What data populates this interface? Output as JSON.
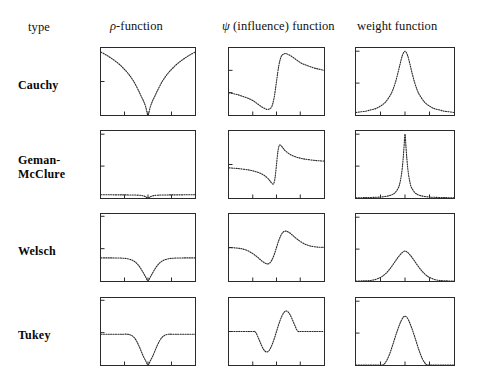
{
  "figure": {
    "kind": "robust-m-estimator-function-table",
    "background": "#ffffff",
    "ink": "#2a2a2a"
  },
  "header": {
    "type_label": "type",
    "rho_label_prefix": "ρ",
    "rho_label_suffix": "-function",
    "psi_label_prefix": "ψ",
    "psi_label_suffix": " (influence) function",
    "weight_label": "weight function"
  },
  "rows": [
    {
      "name": "Cauchy",
      "lines": [
        "Cauchy"
      ]
    },
    {
      "name": "Geman-McClure",
      "lines": [
        "Geman-",
        "McClure"
      ]
    },
    {
      "name": "Welsch",
      "lines": [
        "Welsch"
      ]
    },
    {
      "name": "Tukey",
      "lines": [
        "Tukey"
      ]
    }
  ],
  "columns": [
    {
      "key": "rho",
      "label": "ρ-function"
    },
    {
      "key": "psi",
      "label": "ψ (influence) function"
    },
    {
      "key": "weight",
      "label": "weight function"
    }
  ],
  "chart_data": [
    {
      "id": "cauchy-rho",
      "type": "line",
      "row": "Cauchy",
      "column": "rho",
      "title": "",
      "xlabel": "",
      "ylabel": "",
      "xlim": [
        -10,
        10
      ],
      "ylim": [
        0,
        3.2
      ],
      "grid": false,
      "legend": null,
      "xticks": [
        -10,
        -5,
        0,
        5,
        10
      ],
      "yticks": [
        0,
        1.6,
        3.2
      ],
      "x": [
        -10,
        -9,
        -8,
        -7,
        -6,
        -5,
        -4,
        -3,
        -2,
        -1.5,
        -1,
        -0.5,
        0,
        0.5,
        1,
        1.5,
        2,
        3,
        4,
        5,
        6,
        7,
        8,
        9,
        10
      ],
      "y": [
        3.0,
        2.88,
        2.74,
        2.58,
        2.4,
        2.18,
        1.92,
        1.59,
        1.16,
        0.92,
        0.69,
        0.4,
        0.0,
        0.4,
        0.69,
        0.92,
        1.16,
        1.59,
        1.92,
        2.18,
        2.4,
        2.58,
        2.74,
        2.88,
        3.0
      ]
    },
    {
      "id": "cauchy-psi",
      "type": "line",
      "row": "Cauchy",
      "column": "psi",
      "title": "",
      "xlabel": "",
      "ylabel": "",
      "xlim": [
        -10,
        10
      ],
      "ylim": [
        -0.6,
        0.6
      ],
      "grid": false,
      "legend": null,
      "xticks": [
        -10,
        -5,
        0,
        5,
        10
      ],
      "yticks": [
        -0.6,
        -0.2,
        0.2,
        0.6
      ],
      "x": [
        -10,
        -9,
        -8,
        -7,
        -6,
        -5,
        -4,
        -3,
        -2,
        -1.5,
        -1,
        -0.5,
        0,
        0.5,
        1,
        1.5,
        2,
        3,
        4,
        5,
        6,
        7,
        8,
        9,
        10
      ],
      "y": [
        -0.2,
        -0.22,
        -0.24,
        -0.27,
        -0.3,
        -0.34,
        -0.4,
        -0.46,
        -0.5,
        -0.49,
        -0.45,
        -0.29,
        0.0,
        0.29,
        0.45,
        0.49,
        0.5,
        0.46,
        0.4,
        0.34,
        0.3,
        0.27,
        0.24,
        0.22,
        0.2
      ]
    },
    {
      "id": "cauchy-weight",
      "type": "line",
      "row": "Cauchy",
      "column": "weight",
      "title": "",
      "xlabel": "",
      "ylabel": "",
      "xlim": [
        -10,
        10
      ],
      "ylim": [
        0,
        1.05
      ],
      "grid": false,
      "legend": null,
      "xticks": [
        -10,
        -5,
        0,
        5,
        10
      ],
      "yticks": [
        0,
        0.5,
        1.0
      ],
      "x": [
        -10,
        -9,
        -8,
        -7,
        -6,
        -5,
        -4,
        -3,
        -2.5,
        -2,
        -1.5,
        -1,
        -0.5,
        0,
        0.5,
        1,
        1.5,
        2,
        2.5,
        3,
        4,
        5,
        6,
        7,
        8,
        9,
        10
      ],
      "y": [
        0.04,
        0.05,
        0.06,
        0.08,
        0.1,
        0.14,
        0.2,
        0.31,
        0.39,
        0.5,
        0.64,
        0.8,
        0.94,
        1.0,
        0.94,
        0.8,
        0.64,
        0.5,
        0.39,
        0.31,
        0.2,
        0.14,
        0.1,
        0.08,
        0.06,
        0.05,
        0.04
      ]
    },
    {
      "id": "geman-rho",
      "type": "line",
      "row": "Geman-McClure",
      "column": "rho",
      "title": "",
      "xlabel": "",
      "ylabel": "",
      "xlim": [
        -10,
        10
      ],
      "ylim": [
        0,
        1.05
      ],
      "grid": false,
      "legend": null,
      "xticks": [
        -10,
        -5,
        0,
        5,
        10
      ],
      "yticks": [
        0,
        0.5,
        1.0
      ],
      "x": [
        -10,
        -8,
        -6,
        -5,
        -4,
        -3,
        -2,
        -1.5,
        -1,
        -0.6,
        -0.3,
        0,
        0.3,
        0.6,
        1,
        1.5,
        2,
        3,
        4,
        5,
        6,
        8,
        10
      ],
      "y": [
        0.05,
        0.05,
        0.049,
        0.049,
        0.048,
        0.047,
        0.044,
        0.041,
        0.033,
        0.024,
        0.009,
        0.0,
        0.009,
        0.024,
        0.033,
        0.041,
        0.044,
        0.047,
        0.048,
        0.049,
        0.049,
        0.05,
        0.05
      ]
    },
    {
      "id": "geman-psi",
      "type": "line",
      "row": "Geman-McClure",
      "column": "psi",
      "title": "",
      "xlabel": "",
      "ylabel": "",
      "xlim": [
        -10,
        10
      ],
      "ylim": [
        -0.45,
        0.45
      ],
      "grid": false,
      "legend": null,
      "xticks": [
        -10,
        -5,
        0,
        5,
        10
      ],
      "yticks": [
        -0.45,
        0,
        0.45
      ],
      "x": [
        -10,
        -8,
        -6,
        -5,
        -4,
        -3,
        -2,
        -1.5,
        -1.2,
        -1,
        -0.8,
        -0.6,
        -0.4,
        -0.2,
        0,
        0.2,
        0.4,
        0.6,
        0.8,
        1,
        1.2,
        1.5,
        2,
        3,
        4,
        5,
        6,
        8,
        10
      ],
      "y": [
        -0.045,
        -0.055,
        -0.072,
        -0.085,
        -0.103,
        -0.13,
        -0.175,
        -0.21,
        -0.235,
        -0.25,
        -0.262,
        -0.258,
        -0.215,
        -0.125,
        0.0,
        0.125,
        0.215,
        0.258,
        0.262,
        0.25,
        0.235,
        0.21,
        0.175,
        0.13,
        0.103,
        0.085,
        0.072,
        0.055,
        0.045
      ]
    },
    {
      "id": "geman-weight",
      "type": "line",
      "row": "Geman-McClure",
      "column": "weight",
      "title": "",
      "xlabel": "",
      "ylabel": "",
      "xlim": [
        -10,
        10
      ],
      "ylim": [
        0,
        1.05
      ],
      "grid": false,
      "legend": null,
      "xticks": [
        -10,
        -5,
        0,
        5,
        10
      ],
      "yticks": [
        0,
        0.5,
        1.0
      ],
      "x": [
        -10,
        -8,
        -6,
        -5,
        -4,
        -3,
        -2.5,
        -2,
        -1.5,
        -1.2,
        -1,
        -0.8,
        -0.6,
        -0.4,
        -0.2,
        0,
        0.2,
        0.4,
        0.6,
        0.8,
        1,
        1.2,
        1.5,
        2,
        2.5,
        3,
        4,
        5,
        6,
        8,
        10
      ],
      "y": [
        0.004,
        0.006,
        0.011,
        0.015,
        0.024,
        0.041,
        0.057,
        0.084,
        0.14,
        0.187,
        0.25,
        0.33,
        0.44,
        0.6,
        0.8,
        1.0,
        0.8,
        0.6,
        0.44,
        0.33,
        0.25,
        0.187,
        0.14,
        0.084,
        0.057,
        0.041,
        0.024,
        0.015,
        0.011,
        0.006,
        0.004
      ]
    },
    {
      "id": "welsch-rho",
      "type": "line",
      "row": "Welsch",
      "column": "rho",
      "title": "",
      "xlabel": "",
      "ylabel": "",
      "xlim": [
        -10,
        10
      ],
      "ylim": [
        0,
        1.45
      ],
      "grid": false,
      "legend": null,
      "xticks": [
        -10,
        -5,
        0,
        5,
        10
      ],
      "yticks": [
        0,
        0.7,
        1.4
      ],
      "x": [
        -10,
        -9,
        -8,
        -7,
        -6,
        -5,
        -4.5,
        -4,
        -3.5,
        -3,
        -2.5,
        -2,
        -1.5,
        -1,
        -0.5,
        0,
        0.5,
        1,
        1.5,
        2,
        2.5,
        3,
        3.5,
        4,
        4.5,
        5,
        6,
        7,
        8,
        9,
        10
      ],
      "y": [
        0.5,
        0.5,
        0.5,
        0.499,
        0.497,
        0.49,
        0.484,
        0.473,
        0.456,
        0.43,
        0.392,
        0.337,
        0.264,
        0.177,
        0.088,
        0.0,
        0.088,
        0.177,
        0.264,
        0.337,
        0.392,
        0.43,
        0.456,
        0.473,
        0.484,
        0.49,
        0.497,
        0.499,
        0.5,
        0.5,
        0.5
      ]
    },
    {
      "id": "welsch-psi",
      "type": "line",
      "row": "Welsch",
      "column": "psi",
      "title": "",
      "xlabel": "",
      "ylabel": "",
      "xlim": [
        -10,
        10
      ],
      "ylim": [
        -0.45,
        0.45
      ],
      "grid": false,
      "legend": null,
      "xticks": [
        -10,
        -5,
        0,
        5,
        10
      ],
      "yticks": [
        -0.45,
        0,
        0.45
      ],
      "x": [
        -10,
        -9,
        -8,
        -7,
        -6,
        -5,
        -4.5,
        -4,
        -3.5,
        -3,
        -2.5,
        -2,
        -1.5,
        -1,
        -0.5,
        0,
        0.5,
        1,
        1.5,
        2,
        2.5,
        3,
        3.5,
        4,
        4.5,
        5,
        6,
        7,
        8,
        9,
        10
      ],
      "y": [
        -0.002,
        -0.004,
        -0.01,
        -0.022,
        -0.045,
        -0.082,
        -0.105,
        -0.13,
        -0.158,
        -0.185,
        -0.207,
        -0.22,
        -0.212,
        -0.172,
        -0.098,
        0.0,
        0.098,
        0.172,
        0.212,
        0.22,
        0.207,
        0.185,
        0.158,
        0.13,
        0.105,
        0.082,
        0.045,
        0.022,
        0.01,
        0.004,
        0.002
      ]
    },
    {
      "id": "welsch-weight",
      "type": "line",
      "row": "Welsch",
      "column": "weight",
      "title": "",
      "xlabel": "",
      "ylabel": "",
      "xlim": [
        -10,
        10
      ],
      "ylim": [
        0,
        1.05
      ],
      "grid": false,
      "legend": null,
      "xticks": [
        -10,
        -5,
        0,
        5,
        10
      ],
      "yticks": [
        0,
        0.5,
        1.0
      ],
      "x": [
        -10,
        -9,
        -8,
        -7,
        -6,
        -5,
        -4.5,
        -4,
        -3.5,
        -3,
        -2.5,
        -2,
        -1.5,
        -1,
        -0.5,
        0,
        0.5,
        1,
        1.5,
        2,
        2.5,
        3,
        3.5,
        4,
        4.5,
        5,
        6,
        7,
        8,
        9,
        10
      ],
      "y": [
        0.0,
        0.001,
        0.003,
        0.009,
        0.024,
        0.056,
        0.08,
        0.112,
        0.152,
        0.199,
        0.251,
        0.307,
        0.362,
        0.411,
        0.449,
        0.47,
        0.449,
        0.411,
        0.362,
        0.307,
        0.251,
        0.199,
        0.152,
        0.112,
        0.08,
        0.056,
        0.024,
        0.009,
        0.003,
        0.001,
        0.0
      ]
    },
    {
      "id": "tukey-rho",
      "type": "line",
      "row": "Tukey",
      "column": "rho",
      "title": "",
      "xlabel": "",
      "ylabel": "",
      "xlim": [
        -10,
        10
      ],
      "ylim": [
        0,
        1.45
      ],
      "grid": false,
      "legend": null,
      "xticks": [
        -10,
        -5,
        0,
        5,
        10
      ],
      "yticks": [
        0,
        0.7,
        1.4
      ],
      "x": [
        -10,
        -8,
        -6,
        -5,
        -4.5,
        -4,
        -3.5,
        -3,
        -2.5,
        -2,
        -1.5,
        -1,
        -0.5,
        0,
        0.5,
        1,
        1.5,
        2,
        2.5,
        3,
        3.5,
        4,
        4.5,
        5,
        6,
        8,
        10
      ],
      "y": [
        0.667,
        0.667,
        0.667,
        0.667,
        0.667,
        0.66,
        0.64,
        0.6,
        0.53,
        0.43,
        0.31,
        0.19,
        0.092,
        0.0,
        0.092,
        0.19,
        0.31,
        0.43,
        0.53,
        0.6,
        0.64,
        0.66,
        0.667,
        0.667,
        0.667,
        0.667,
        0.667
      ]
    },
    {
      "id": "tukey-psi",
      "type": "line",
      "row": "Tukey",
      "column": "psi",
      "title": "",
      "xlabel": "",
      "ylabel": "",
      "xlim": [
        -10,
        10
      ],
      "ylim": [
        -0.45,
        0.45
      ],
      "grid": false,
      "legend": null,
      "xticks": [
        -10,
        -5,
        0,
        5,
        10
      ],
      "yticks": [
        -0.45,
        0,
        0.45
      ],
      "x": [
        -10,
        -8,
        -6,
        -5,
        -4.6,
        -4.3,
        -4,
        -3.6,
        -3.2,
        -2.8,
        -2.4,
        -2,
        -1.6,
        -1.2,
        -0.8,
        -0.4,
        0,
        0.4,
        0.8,
        1.2,
        1.6,
        2,
        2.4,
        2.8,
        3.2,
        3.6,
        4,
        4.3,
        4.6,
        5,
        6,
        8,
        10
      ],
      "y": [
        0.0,
        0.0,
        0.0,
        0.0,
        0.0,
        -0.02,
        -0.06,
        -0.12,
        -0.18,
        -0.232,
        -0.265,
        -0.275,
        -0.258,
        -0.216,
        -0.155,
        -0.082,
        0.0,
        0.082,
        0.155,
        0.216,
        0.258,
        0.275,
        0.265,
        0.232,
        0.18,
        0.12,
        0.06,
        0.02,
        0.0,
        0.0,
        0.0,
        0.0,
        0.0
      ]
    },
    {
      "id": "tukey-weight",
      "type": "line",
      "row": "Tukey",
      "column": "weight",
      "title": "",
      "xlabel": "",
      "ylabel": "",
      "xlim": [
        -10,
        10
      ],
      "ylim": [
        0,
        1.05
      ],
      "grid": false,
      "legend": null,
      "xticks": [
        -10,
        -5,
        0,
        5,
        10
      ],
      "yticks": [
        0,
        0.5,
        1.0
      ],
      "x": [
        -10,
        -8,
        -6,
        -5,
        -4.6,
        -4.3,
        -4,
        -3.6,
        -3.2,
        -2.8,
        -2.4,
        -2,
        -1.6,
        -1.2,
        -0.8,
        -0.4,
        0,
        0.4,
        0.8,
        1.2,
        1.6,
        2,
        2.4,
        2.8,
        3.2,
        3.6,
        4,
        4.3,
        4.6,
        5,
        6,
        8,
        10
      ],
      "y": [
        0.0,
        0.0,
        0.0,
        0.0,
        0.0,
        0.01,
        0.038,
        0.09,
        0.16,
        0.245,
        0.34,
        0.437,
        0.53,
        0.615,
        0.69,
        0.745,
        0.765,
        0.745,
        0.69,
        0.615,
        0.53,
        0.437,
        0.34,
        0.245,
        0.16,
        0.09,
        0.038,
        0.01,
        0.0,
        0.0,
        0.0,
        0.0,
        0.0
      ]
    }
  ],
  "layout": {
    "panel_x": [
      100,
      228,
      355
    ],
    "panel_w": [
      96,
      97,
      100
    ],
    "panel_y": [
      47,
      130,
      213,
      297
    ],
    "panel_h": [
      69,
      69,
      69,
      69
    ]
  }
}
